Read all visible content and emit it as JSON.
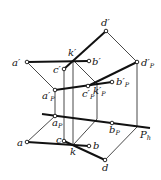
{
  "diagram": {
    "title": "",
    "plane_label": "Pk",
    "points": {
      "d_prime": {
        "label": "d'",
        "x": 106,
        "y": 31
      },
      "a_prime": {
        "label": "a'",
        "x": 27,
        "y": 62
      },
      "k_prime": {
        "label": "k'",
        "x": 73,
        "y": 60
      },
      "b_prime": {
        "label": "b'",
        "x": 89,
        "y": 61
      },
      "c_prime": {
        "label": "c'",
        "x": 64,
        "y": 69
      },
      "d_prime_p": {
        "label": "d'p",
        "x": 137,
        "y": 62
      },
      "b_prime_p": {
        "label": "b'p",
        "x": 112,
        "y": 82
      },
      "k_prime_p": {
        "label": "k'p",
        "x": 97,
        "y": 84
      },
      "a_prime_p": {
        "label": "a'p",
        "x": 55,
        "y": 90
      },
      "c_prime_p": {
        "label": "c'p",
        "x": 88,
        "y": 86
      },
      "a_p": {
        "label": "ap",
        "x": 55,
        "y": 116
      },
      "b_p": {
        "label": "bp",
        "x": 112,
        "y": 123
      },
      "a": {
        "label": "a",
        "x": 27,
        "y": 142
      },
      "c": {
        "label": "c",
        "x": 64,
        "y": 141
      },
      "k": {
        "label": "k",
        "x": 74,
        "y": 144
      },
      "b": {
        "label": "b",
        "x": 89,
        "y": 146
      },
      "d": {
        "label": "d",
        "x": 105,
        "y": 160
      }
    },
    "labels": {
      "d_prime": "d′",
      "a_prime": "a′",
      "k_prime": "k′",
      "b_prime": "b′",
      "c_prime": "c′",
      "d_prime_p": "d′",
      "d_prime_p_sub": "P",
      "b_prime_p": "b′",
      "b_prime_p_sub": "P",
      "k_prime_p": "k′",
      "k_prime_p_sub": "P",
      "a_prime_p": "a′",
      "a_prime_p_sub": "P",
      "c_prime_p": "c′",
      "c_prime_p_sub": "P",
      "a_p": "a",
      "a_p_sub": "P",
      "b_p": "b",
      "b_p_sub": "P",
      "P": "P",
      "P_sub": "h",
      "a": "a",
      "c": "c",
      "k": "k",
      "b": "b",
      "d": "d"
    }
  }
}
